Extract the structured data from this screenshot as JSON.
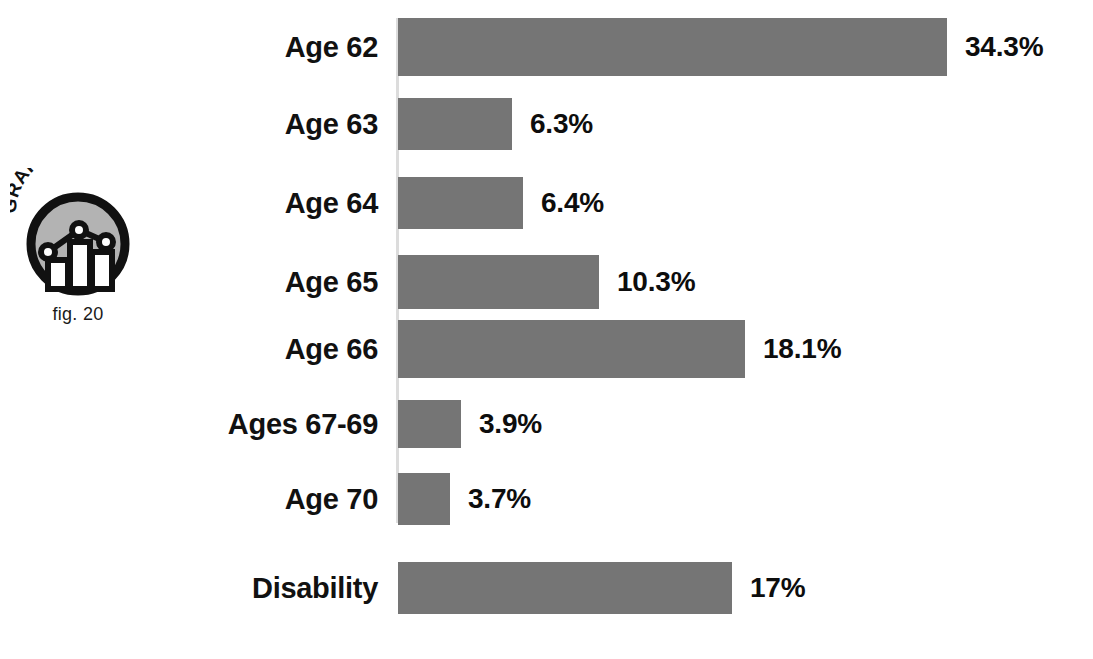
{
  "badge": {
    "wordmark": "GRAPHIC",
    "caption": "fig. 20",
    "logo_icon": "line-bar-chart-icon"
  },
  "chart_data": {
    "type": "bar",
    "orientation": "horizontal",
    "title": "",
    "subtitle": "",
    "xlabel": "",
    "ylabel": "",
    "grid": false,
    "legend": false,
    "axis_line": true,
    "value_suffix": "%",
    "xlim": [
      0,
      34.3
    ],
    "categories": [
      "Age 62",
      "Age 63",
      "Age 64",
      "Age 65",
      "Age 66",
      "Ages 67-69",
      "Age 70",
      "Disability"
    ],
    "values": [
      34.3,
      6.3,
      6.4,
      10.3,
      18.1,
      3.9,
      3.7,
      17
    ],
    "value_labels": [
      "34.3%",
      "6.3%",
      "6.4%",
      "10.3%",
      "18.1%",
      "3.9%",
      "3.7%",
      "17%"
    ],
    "bar_color": "#757575",
    "label_color": "#111111",
    "background": "#ffffff",
    "bars_pixels": [
      {
        "top": 18,
        "height": 58,
        "width": 549
      },
      {
        "top": 98,
        "height": 52,
        "width": 114
      },
      {
        "top": 177,
        "height": 52,
        "width": 125
      },
      {
        "top": 255,
        "height": 54,
        "width": 201
      },
      {
        "top": 320,
        "height": 58,
        "width": 347
      },
      {
        "top": 400,
        "height": 48,
        "width": 63
      },
      {
        "top": 473,
        "height": 52,
        "width": 52
      },
      {
        "top": 562,
        "height": 52,
        "width": 334
      }
    ]
  }
}
